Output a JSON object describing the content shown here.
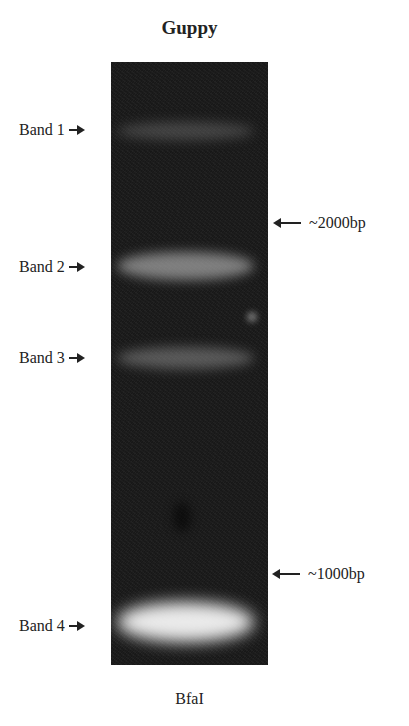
{
  "figure": {
    "title": "Guppy",
    "lane_label": "BfaI",
    "bands": [
      {
        "label": "Band 1"
      },
      {
        "label": "Band 2"
      },
      {
        "label": "Band 3"
      },
      {
        "label": "Band 4"
      }
    ],
    "markers": [
      {
        "label": "~2000bp"
      },
      {
        "label": "~1000bp"
      }
    ]
  }
}
